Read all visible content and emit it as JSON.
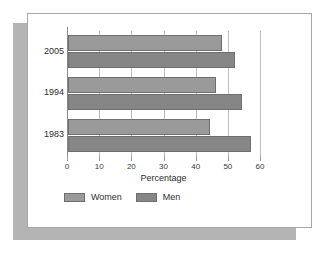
{
  "chart_data": {
    "type": "bar",
    "orientation": "horizontal",
    "title": "",
    "xlabel": "Percentage",
    "ylabel": "",
    "categories": [
      "2005",
      "1994",
      "1983"
    ],
    "series": [
      {
        "name": "Women",
        "values": [
          48,
          46,
          44
        ],
        "color": "#9a9a9a"
      },
      {
        "name": "Men",
        "values": [
          52,
          54,
          57
        ],
        "color": "#868686"
      }
    ],
    "xlim": [
      0,
      60
    ],
    "xticks": [
      0,
      10,
      20,
      30,
      40,
      50,
      60
    ],
    "xticklabels": [
      "0",
      "10",
      "20",
      "30",
      "40",
      "50",
      "60"
    ],
    "grid": true,
    "grid_axis": "x",
    "legend_position": "bottom-left"
  },
  "legend": {
    "items": [
      {
        "label": "Women"
      },
      {
        "label": "Men"
      }
    ]
  },
  "colors": {
    "women": "#9a9a9a",
    "men": "#868686",
    "bar_border": "#6f6f6f",
    "gridline": "#bdbdbd",
    "axis": "#8a8a8a",
    "card_background": "#ffffff",
    "card_border": "#a8a8a8",
    "shadow_card": "#b4b4b4",
    "page_background": "#ffffff"
  }
}
